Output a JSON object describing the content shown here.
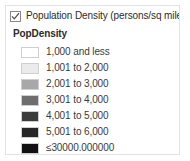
{
  "panel": {
    "name": "legend-panel",
    "background": "#ffffff",
    "border_color": "#e3e3e3"
  },
  "layer": {
    "label": "Population Density (persons/sq mile)",
    "checked": true,
    "checkbox_icon": "checkmark-icon"
  },
  "field": {
    "title": "PopDensity"
  },
  "classes": [
    {
      "label": "1,000 and less",
      "color": "#ffffff"
    },
    {
      "label": "1,001 to 2,000",
      "color": "#ebebeb"
    },
    {
      "label": "2,001 to 3,000",
      "color": "#a8a8a8"
    },
    {
      "label": "3,001 to 4,000",
      "color": "#6e6e6e"
    },
    {
      "label": "4,001 to 5,000",
      "color": "#3b3b3b"
    },
    {
      "label": "5,001 to 6,000",
      "color": "#262626"
    },
    {
      "label": "≤30000.000000",
      "color": "#111111"
    }
  ]
}
